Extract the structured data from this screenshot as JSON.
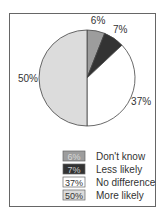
{
  "chart_data": {
    "type": "pie",
    "title": "",
    "start_angle_deg": 0,
    "direction": "clockwise",
    "slices": [
      {
        "label": "Don't know",
        "value": 6,
        "display": "6%",
        "color": "#9d9d9d",
        "text_color": "#d8d8d8"
      },
      {
        "label": "Less likely",
        "value": 7,
        "display": "7%",
        "color": "#333333",
        "text_color": "#cfcfcf"
      },
      {
        "label": "No difference",
        "value": 37,
        "display": "37%",
        "color": "#ffffff",
        "text_color": "#333333"
      },
      {
        "label": "More likely",
        "value": 50,
        "display": "50%",
        "color": "#dcdcdc",
        "text_color": "#333333"
      }
    ],
    "legend": {
      "placement": "bottom-right"
    }
  }
}
